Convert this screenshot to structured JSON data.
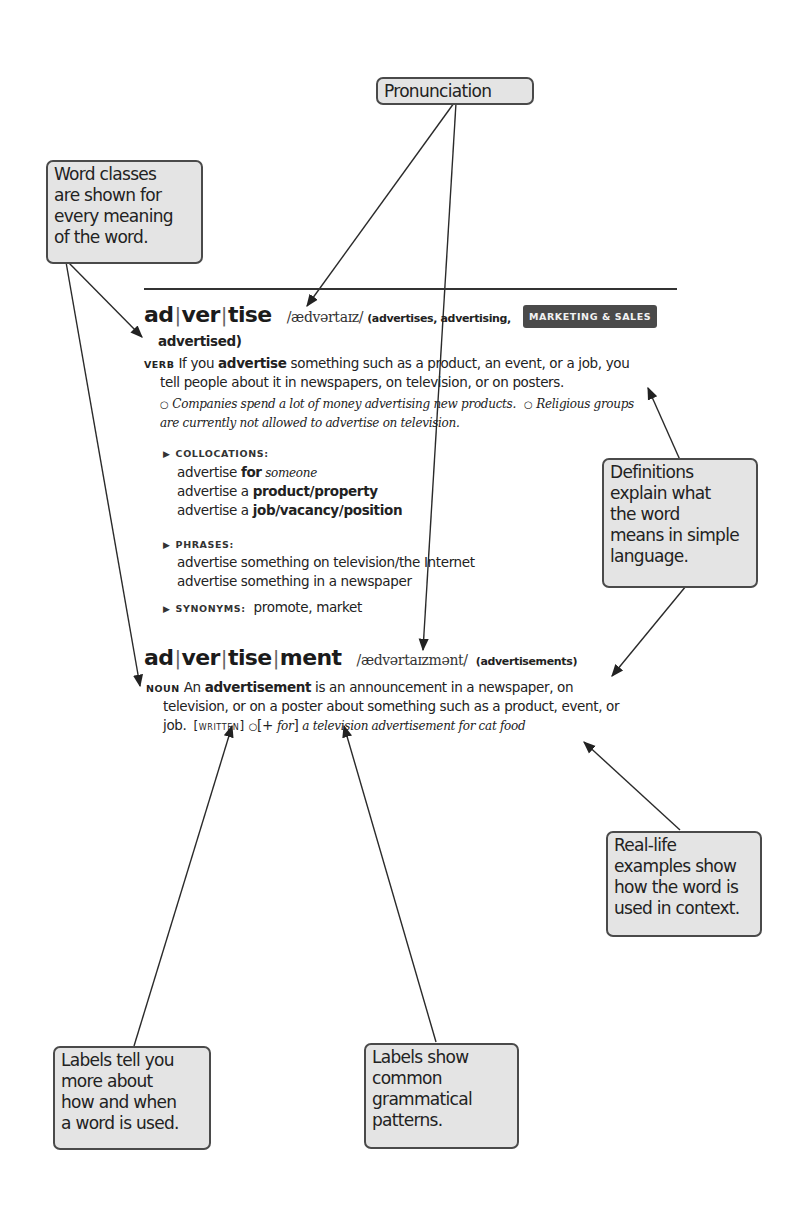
{
  "callouts": {
    "pronunciation": "Pronunciation",
    "word_classes": "Word classes\nare shown for\nevery meaning\nof the word.",
    "definitions": "Definitions\nexplain what\nthe word\nmeans in simple\nlanguage.",
    "examples": "Real-life\nexamples show\nhow the word is\nused in context.",
    "labels_usage": "Labels tell you\nmore about\nhow and when\na word is used.",
    "labels_grammar": "Labels show\ncommon\ngrammatical\npatterns."
  },
  "entry1": {
    "syllables": [
      "ad",
      "ver",
      "tise"
    ],
    "pronunciation": "/ædvərtaɪz/",
    "inflections_1": "(advertises, advertising,",
    "inflections_2": "advertised)",
    "badge": "MARKETING & SALES",
    "pos": "VERB",
    "def_prefix": "If you ",
    "def_bold": "advertise",
    "def_rest_1": " something such as a product, an event, or a job, you",
    "def_line_2": "tell people about it in newspapers, on television, or on posters.",
    "example_marker": "○",
    "example_1": "Companies spend a lot of money advertising new products.",
    "example_2a": "Religious groups",
    "example_2b": "are currently not allowed to advertise on television.",
    "collocations": {
      "label": "COLLOCATIONS:",
      "items": [
        {
          "plain": "advertise ",
          "bold": "for",
          "italic": " someone"
        },
        {
          "plain": "advertise a ",
          "bold": "product/property",
          "italic": ""
        },
        {
          "plain": "advertise a ",
          "bold": "job/vacancy/position",
          "italic": ""
        }
      ]
    },
    "phrases": {
      "label": "PHRASES:",
      "items": [
        "advertise something on television/the Internet",
        "advertise something in a newspaper"
      ]
    },
    "synonyms": {
      "label": "SYNONYMS:",
      "value": "promote, market"
    }
  },
  "entry2": {
    "syllables": [
      "ad",
      "ver",
      "tise",
      "ment"
    ],
    "pronunciation": "/ædvərtaɪzmənt/",
    "inflections": "(advertisements)",
    "pos": "NOUN",
    "def_prefix": "An ",
    "def_bold": "advertisement",
    "def_rest_1": " is an announcement in a newspaper, on",
    "def_line_2": "television, or on a poster about something such as a product, event, or",
    "def_line_3": "job.",
    "label_written": "[written]",
    "example_marker": "○",
    "grammar_pattern_open": "[+ ",
    "grammar_pattern_word": "for",
    "grammar_pattern_close": "]",
    "example": "a television advertisement for cat food"
  }
}
